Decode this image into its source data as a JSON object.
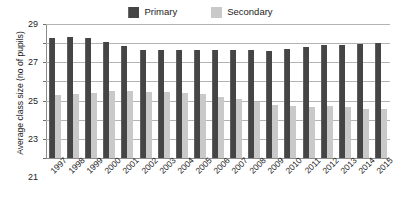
{
  "chart_data": {
    "type": "bar",
    "title": "",
    "xlabel": "",
    "ylabel": "Average class size (no of pupils)",
    "ylim": [
      15,
      29
    ],
    "yticks": [
      15,
      17,
      19,
      21,
      23,
      25,
      27,
      29
    ],
    "grid": true,
    "legend_position": "top-center",
    "categories": [
      "1997",
      "1998",
      "1999",
      "2000",
      "2001",
      "2002",
      "2003",
      "2004",
      "2005",
      "2006",
      "2007",
      "2008",
      "2009",
      "2010",
      "2011",
      "2012",
      "2013",
      "2014",
      "2015"
    ],
    "series": [
      {
        "name": "Primary",
        "color": "#454545",
        "values": [
          27.5,
          27.6,
          27.5,
          27.1,
          26.7,
          26.3,
          26.3,
          26.3,
          26.3,
          26.3,
          26.3,
          26.3,
          26.2,
          26.4,
          26.6,
          26.8,
          26.8,
          26.9,
          27.0
        ]
      },
      {
        "name": "Secondary",
        "color": "#c9c9c9",
        "values": [
          21.6,
          21.7,
          21.8,
          22.0,
          22.0,
          21.9,
          21.9,
          21.8,
          21.7,
          21.4,
          21.2,
          20.9,
          20.5,
          20.4,
          20.3,
          20.4,
          20.3,
          20.1,
          20.1
        ]
      }
    ]
  },
  "legend": {
    "items": [
      {
        "label": "Primary",
        "swatch": "primary"
      },
      {
        "label": "Secondary",
        "swatch": "secondary"
      }
    ]
  }
}
